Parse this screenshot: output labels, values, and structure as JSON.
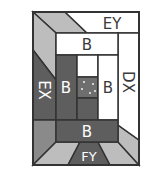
{
  "diagram": {
    "type": "quilt-block-layout",
    "colors": {
      "white": "#ffffff",
      "light_gray": "#bdbdbd",
      "mid_gray": "#8a8a8a",
      "dark_gray": "#5e5e5e",
      "outline": "#333333",
      "label_dark": "#3a3a3a",
      "label_light": "#ffffff"
    },
    "labels": {
      "top": "EY",
      "top_bar": "B",
      "left": "EX",
      "right": "DX",
      "center_left": "B",
      "center_right": "B",
      "bottom_bar": "B",
      "bottom": "FY"
    }
  }
}
